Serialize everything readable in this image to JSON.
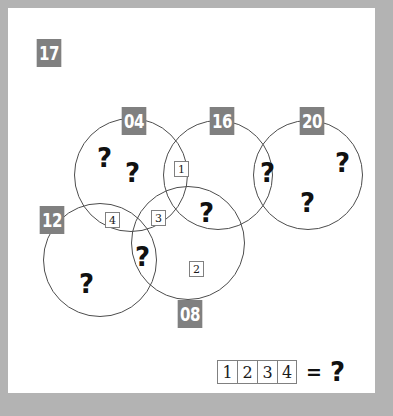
{
  "puzzle": {
    "id_badge": "17",
    "colors": {
      "page_background": "#b3b3b3",
      "card_background": "#ffffff",
      "badge_fill": "#808080",
      "badge_text": "#ffffff",
      "circle_stroke": "#4d4d4d",
      "tile_stroke": "#808080",
      "glyph": "#111111"
    },
    "circles": [
      {
        "label": "04",
        "cx": 123,
        "cy": 167,
        "r": 57,
        "badge_x": 112,
        "badge_y": 99
      },
      {
        "label": "16",
        "cx": 210,
        "cy": 167,
        "r": 55,
        "badge_x": 200,
        "badge_y": 99
      },
      {
        "label": "20",
        "cx": 300,
        "cy": 167,
        "r": 55,
        "badge_x": 290,
        "badge_y": 99
      },
      {
        "label": "12",
        "cx": 92,
        "cy": 252,
        "r": 57,
        "badge_x": 30,
        "badge_y": 198
      },
      {
        "label": "08",
        "cx": 180,
        "cy": 235,
        "r": 57,
        "badge_x": 168,
        "badge_y": 292
      }
    ],
    "region_tiles": [
      {
        "value": "1",
        "x": 166,
        "y": 153
      },
      {
        "value": "2",
        "x": 181,
        "y": 253
      },
      {
        "value": "3",
        "x": 143,
        "y": 202
      },
      {
        "value": "4",
        "x": 97,
        "y": 204
      }
    ],
    "question_marks": [
      {
        "x": 89,
        "y": 137
      },
      {
        "x": 117,
        "y": 152
      },
      {
        "x": 191,
        "y": 192
      },
      {
        "x": 252,
        "y": 152
      },
      {
        "x": 292,
        "y": 182
      },
      {
        "x": 327,
        "y": 142
      },
      {
        "x": 127,
        "y": 236
      },
      {
        "x": 71,
        "y": 263
      }
    ],
    "equation": {
      "boxes": [
        "1",
        "2",
        "3",
        "4"
      ],
      "equals": "=",
      "answer": "?"
    }
  }
}
